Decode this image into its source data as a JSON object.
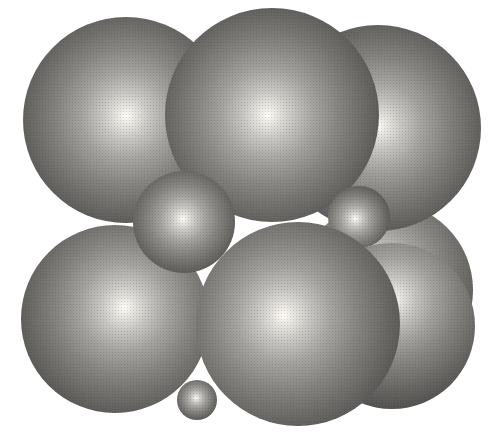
{
  "figure": {
    "kind": "sphere-packing-model",
    "background_color": "#ffffff",
    "canvas": {
      "width": 503,
      "height": 443
    },
    "gradient_stops": [
      "#fdfcf8 0%",
      "#ece9e4 5%",
      "#c7c6c2 16%",
      "#a4a39f 30%",
      "#868581 46%",
      "#6d6c69 62%",
      "#585755 76%",
      "#494947 88%",
      "#3f3f3e 96%",
      "#3a3a39 100%"
    ],
    "spheres": [
      {
        "name": "back-right-large-sphere",
        "size": "large",
        "cx": 385,
        "cy": 290,
        "r": 88,
        "hx": 45,
        "hy": 40
      },
      {
        "name": "top-left-large-sphere",
        "size": "large",
        "cx": 126,
        "cy": 120,
        "r": 103,
        "hx": 50,
        "hy": 48
      },
      {
        "name": "top-right-large-sphere",
        "size": "large",
        "cx": 378,
        "cy": 128,
        "r": 103,
        "hx": 50,
        "hy": 49
      },
      {
        "name": "top-center-large-sphere",
        "size": "large",
        "cx": 272,
        "cy": 115,
        "r": 107,
        "hx": 48,
        "hy": 50
      },
      {
        "name": "middle-right-small-sphere",
        "size": "small",
        "cx": 359,
        "cy": 217,
        "r": 31,
        "hx": 44,
        "hy": 53
      },
      {
        "name": "bottom-left-large-sphere",
        "size": "large",
        "cx": 115,
        "cy": 319,
        "r": 94,
        "hx": 55,
        "hy": 44
      },
      {
        "name": "bottom-right-large-sphere",
        "size": "large",
        "cx": 392,
        "cy": 326,
        "r": 83,
        "hx": 50,
        "hy": 34
      },
      {
        "name": "bottom-center-large-sphere",
        "size": "large",
        "cx": 298,
        "cy": 324,
        "r": 102,
        "hx": 43,
        "hy": 46
      },
      {
        "name": "middle-left-small-sphere",
        "size": "small",
        "cx": 184,
        "cy": 222,
        "r": 51,
        "hx": 49,
        "hy": 47
      },
      {
        "name": "bottom-tiny-sphere",
        "size": "tiny",
        "cx": 197,
        "cy": 400,
        "r": 20,
        "hx": 48,
        "hy": 45
      }
    ]
  }
}
